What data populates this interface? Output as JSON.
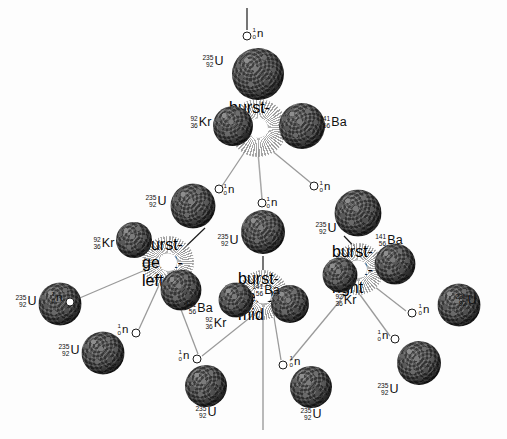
{
  "diagram": {
    "background_color": "#fdfdfd",
    "nucleus_color": "#3a3a3a",
    "burst_color": "#ffffff",
    "line_color": "#8c8c8c",
    "arrow_color": "#1b1b1b"
  },
  "species": {
    "uranium": {
      "mass": "235",
      "atomic": "92",
      "symbol": "U"
    },
    "krypton": {
      "mass": "92",
      "atomic": "36",
      "symbol": "Kr"
    },
    "barium": {
      "mass": "141",
      "atomic": "56",
      "symbol": "Ba"
    },
    "neutron": {
      "mass": "1",
      "atomic": "0",
      "symbol": "n"
    }
  },
  "labels": [
    {
      "id": "n-incident-top",
      "mass": "1",
      "atomic": "0",
      "symbol": "n",
      "x": 258,
      "y": 34
    },
    {
      "id": "u-gen1",
      "mass": "235",
      "atomic": "92",
      "symbol": "U",
      "x": 213,
      "y": 61
    },
    {
      "id": "kr-gen1",
      "mass": "92",
      "atomic": "36",
      "symbol": "Kr",
      "x": 201,
      "y": 122
    },
    {
      "id": "ba-gen1",
      "mass": "141",
      "atomic": "56",
      "symbol": "Ba",
      "x": 333,
      "y": 122
    },
    {
      "id": "n-gen2-left",
      "mass": "1",
      "atomic": "0",
      "symbol": "n",
      "x": 229,
      "y": 190
    },
    {
      "id": "n-gen2-mid",
      "mass": "1",
      "atomic": "0",
      "symbol": "n",
      "x": 272,
      "y": 203
    },
    {
      "id": "n-gen2-right",
      "mass": "1",
      "atomic": "0",
      "symbol": "n",
      "x": 325,
      "y": 187
    },
    {
      "id": "u-gen2-left",
      "mass": "235",
      "atomic": "92",
      "symbol": "U",
      "x": 156,
      "y": 201
    },
    {
      "id": "u-gen2-mid",
      "mass": "235",
      "atomic": "92",
      "symbol": "U",
      "x": 228,
      "y": 240
    },
    {
      "id": "u-gen2-right",
      "mass": "235",
      "atomic": "92",
      "symbol": "U",
      "x": 326,
      "y": 228
    },
    {
      "id": "kr-gen2-left",
      "mass": "92",
      "atomic": "36",
      "symbol": "Kr",
      "x": 104,
      "y": 243
    },
    {
      "id": "ba-gen2-left",
      "mass": "141",
      "atomic": "56",
      "symbol": "Ba",
      "x": 199,
      "y": 308
    },
    {
      "id": "ba-gen2-right",
      "mass": "141",
      "atomic": "56",
      "symbol": "Ba",
      "x": 389,
      "y": 240
    },
    {
      "id": "kr-gen2-right",
      "mass": "92",
      "atomic": "36",
      "symbol": "Kr",
      "x": 346,
      "y": 300
    },
    {
      "id": "kr-gen2-mid",
      "mass": "92",
      "atomic": "36",
      "symbol": "Kr",
      "x": 216,
      "y": 323
    },
    {
      "id": "ba-gen2-mid",
      "mass": "141",
      "atomic": "56",
      "symbol": "Ba",
      "x": 266,
      "y": 290
    },
    {
      "id": "n-gen3-a",
      "mass": "1",
      "atomic": "0",
      "symbol": "n",
      "x": 57,
      "y": 298
    },
    {
      "id": "n-gen3-b",
      "mass": "1",
      "atomic": "0",
      "symbol": "n",
      "x": 123,
      "y": 330
    },
    {
      "id": "n-gen3-c",
      "mass": "1",
      "atomic": "0",
      "symbol": "n",
      "x": 184,
      "y": 356
    },
    {
      "id": "n-gen3-d",
      "mass": "1",
      "atomic": "0",
      "symbol": "n",
      "x": 295,
      "y": 362
    },
    {
      "id": "n-gen3-e",
      "mass": "1",
      "atomic": "0",
      "symbol": "n",
      "x": 383,
      "y": 336
    },
    {
      "id": "n-gen3-f",
      "mass": "1",
      "atomic": "0",
      "symbol": "n",
      "x": 424,
      "y": 310
    },
    {
      "id": "u-gen3-a",
      "mass": "235",
      "atomic": "92",
      "symbol": "U",
      "x": 26,
      "y": 301
    },
    {
      "id": "u-gen3-b",
      "mass": "235",
      "atomic": "92",
      "symbol": "U",
      "x": 69,
      "y": 350
    },
    {
      "id": "u-gen3-c",
      "mass": "235",
      "atomic": "92",
      "symbol": "U",
      "x": 206,
      "y": 412
    },
    {
      "id": "u-gen3-d",
      "mass": "235",
      "atomic": "92",
      "symbol": "U",
      "x": 311,
      "y": 414
    },
    {
      "id": "u-gen3-e",
      "mass": "235",
      "atomic": "92",
      "symbol": "U",
      "x": 388,
      "y": 389
    },
    {
      "id": "u-gen3-f",
      "mass": "235",
      "atomic": "92",
      "symbol": "U",
      "x": 466,
      "y": 300
    }
  ],
  "nuclei": [
    {
      "id": "u-gen1-sphere",
      "x": 258,
      "y": 74,
      "d": 52
    },
    {
      "id": "kr-gen1-sphere",
      "x": 233,
      "y": 126,
      "d": 40
    },
    {
      "id": "ba-gen1-sphere",
      "x": 302,
      "y": 126,
      "d": 46
    },
    {
      "id": "u-gen2-left-s",
      "x": 193,
      "y": 206,
      "d": 45
    },
    {
      "id": "u-gen2-mid-s",
      "x": 263,
      "y": 232,
      "d": 44
    },
    {
      "id": "u-gen2-right-s",
      "x": 358,
      "y": 213,
      "d": 47
    },
    {
      "id": "kr-gen2-left-s",
      "x": 134,
      "y": 240,
      "d": 36
    },
    {
      "id": "ba-gen2-left-s",
      "x": 181,
      "y": 290,
      "d": 41
    },
    {
      "id": "ba-gen2-right-s",
      "x": 395,
      "y": 264,
      "d": 41
    },
    {
      "id": "kr-gen2-right-s",
      "x": 340,
      "y": 275,
      "d": 35
    },
    {
      "id": "kr-gen2-mid-s",
      "x": 236,
      "y": 300,
      "d": 35
    },
    {
      "id": "ba-gen2-mid-s",
      "x": 290,
      "y": 304,
      "d": 38
    },
    {
      "id": "u-gen3-a-s",
      "x": 60,
      "y": 304,
      "d": 43
    },
    {
      "id": "u-gen3-b-s",
      "x": 103,
      "y": 353,
      "d": 43
    },
    {
      "id": "u-gen3-c-s",
      "x": 206,
      "y": 386,
      "d": 42
    },
    {
      "id": "u-gen3-d-s",
      "x": 311,
      "y": 387,
      "d": 42
    },
    {
      "id": "u-gen3-e-s",
      "x": 419,
      "y": 363,
      "d": 44
    },
    {
      "id": "u-gen3-f-s",
      "x": 459,
      "y": 305,
      "d": 43
    }
  ],
  "bursts": [
    {
      "id": "burst-gen1",
      "x": 258,
      "y": 128,
      "d": 58
    },
    {
      "id": "burst-gen2-left",
      "x": 168,
      "y": 262,
      "d": 52
    },
    {
      "id": "burst-gen2-mid",
      "x": 263,
      "y": 295,
      "d": 50
    },
    {
      "id": "burst-gen2-right",
      "x": 358,
      "y": 269,
      "d": 52
    }
  ],
  "neutrons": [
    {
      "id": "n-top",
      "x": 247,
      "y": 36
    },
    {
      "id": "n-l2-a",
      "x": 219,
      "y": 189
    },
    {
      "id": "n-l2-b",
      "x": 262,
      "y": 203
    },
    {
      "id": "n-l2-c",
      "x": 314,
      "y": 186
    },
    {
      "id": "n-l3-a",
      "x": 70,
      "y": 302
    },
    {
      "id": "n-l3-b",
      "x": 136,
      "y": 333
    },
    {
      "id": "n-l3-c",
      "x": 197,
      "y": 359
    },
    {
      "id": "n-l3-d",
      "x": 283,
      "y": 365
    },
    {
      "id": "n-l3-e",
      "x": 395,
      "y": 339
    },
    {
      "id": "n-l3-f",
      "x": 412,
      "y": 313
    }
  ]
}
